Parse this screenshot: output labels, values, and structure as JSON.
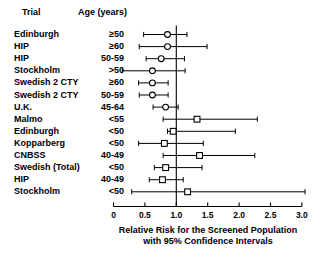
{
  "header": {
    "trial_label": "Trial",
    "age_label": "Age (years)"
  },
  "axis": {
    "x_title_line1": "Relative Risk for the Screened Population",
    "x_title_line2": "with 95% Confidence Intervals",
    "ticks": [
      "0",
      "0.5",
      "1.0",
      "1.5",
      "2.0",
      "2.5",
      "3.0"
    ],
    "reference_line_value": 1.0
  },
  "chart_data": {
    "type": "scatter",
    "title": "",
    "xlabel": "Relative Risk for the Screened Population with 95% Confidence Intervals",
    "ylabel": "",
    "xlim": [
      0,
      3.0
    ],
    "xticks": [
      0,
      0.5,
      1.0,
      1.5,
      2.0,
      2.5,
      3.0
    ],
    "xticklabels": [
      "0",
      "0.5",
      "1.0",
      "1.5",
      "2.0",
      "2.5",
      "3.0"
    ],
    "grid": false,
    "legend": "none",
    "reference_line": 1.0,
    "marker_shapes": [
      "circle",
      "square"
    ],
    "rows": [
      {
        "trial": "Edinburgh",
        "age": "≥50",
        "rr": 0.86,
        "ci_low": 0.48,
        "ci_high": 1.17,
        "marker": "circle"
      },
      {
        "trial": "HIP",
        "age": "≥60",
        "rr": 0.86,
        "ci_low": 0.41,
        "ci_high": 1.49,
        "marker": "circle"
      },
      {
        "trial": "HIP",
        "age": "50-59",
        "rr": 0.76,
        "ci_low": 0.52,
        "ci_high": 1.13,
        "marker": "circle"
      },
      {
        "trial": "Stockholm",
        "age": ">50",
        "rr": 0.62,
        "ci_low": 0.14,
        "ci_high": 1.14,
        "marker": "circle"
      },
      {
        "trial": "Swedish 2 CTY",
        "age": "≥60",
        "rr": 0.62,
        "ci_low": 0.4,
        "ci_high": 0.87,
        "marker": "circle"
      },
      {
        "trial": "Swedish 2 CTY",
        "age": "50-59",
        "rr": 0.62,
        "ci_low": 0.41,
        "ci_high": 0.87,
        "marker": "circle"
      },
      {
        "trial": "U.K.",
        "age": "45-64",
        "rr": 0.83,
        "ci_low": 0.63,
        "ci_high": 1.03,
        "marker": "circle"
      },
      {
        "trial": "Malmo",
        "age": "<55",
        "rr": 1.33,
        "ci_low": 0.79,
        "ci_high": 2.29,
        "marker": "square"
      },
      {
        "trial": "Edinburgh",
        "age": "<50",
        "rr": 0.95,
        "ci_low": 0.86,
        "ci_high": 1.94,
        "marker": "square"
      },
      {
        "trial": "Kopparberg",
        "age": "<50",
        "rr": 0.81,
        "ci_low": 0.4,
        "ci_high": 1.43,
        "marker": "square"
      },
      {
        "trial": "CNBSS",
        "age": "40-49",
        "rr": 1.37,
        "ci_low": 0.79,
        "ci_high": 2.25,
        "marker": "square"
      },
      {
        "trial": "Swedish (Total)",
        "age": "<50",
        "rr": 0.83,
        "ci_low": 0.65,
        "ci_high": 1.41,
        "marker": "square"
      },
      {
        "trial": "HIP",
        "age": "40-49",
        "rr": 0.78,
        "ci_low": 0.57,
        "ci_high": 1.11,
        "marker": "square"
      },
      {
        "trial": "Stockholm",
        "age": "<50",
        "rr": 1.18,
        "ci_low": 0.29,
        "ci_high": 3.05,
        "marker": "square"
      }
    ]
  }
}
